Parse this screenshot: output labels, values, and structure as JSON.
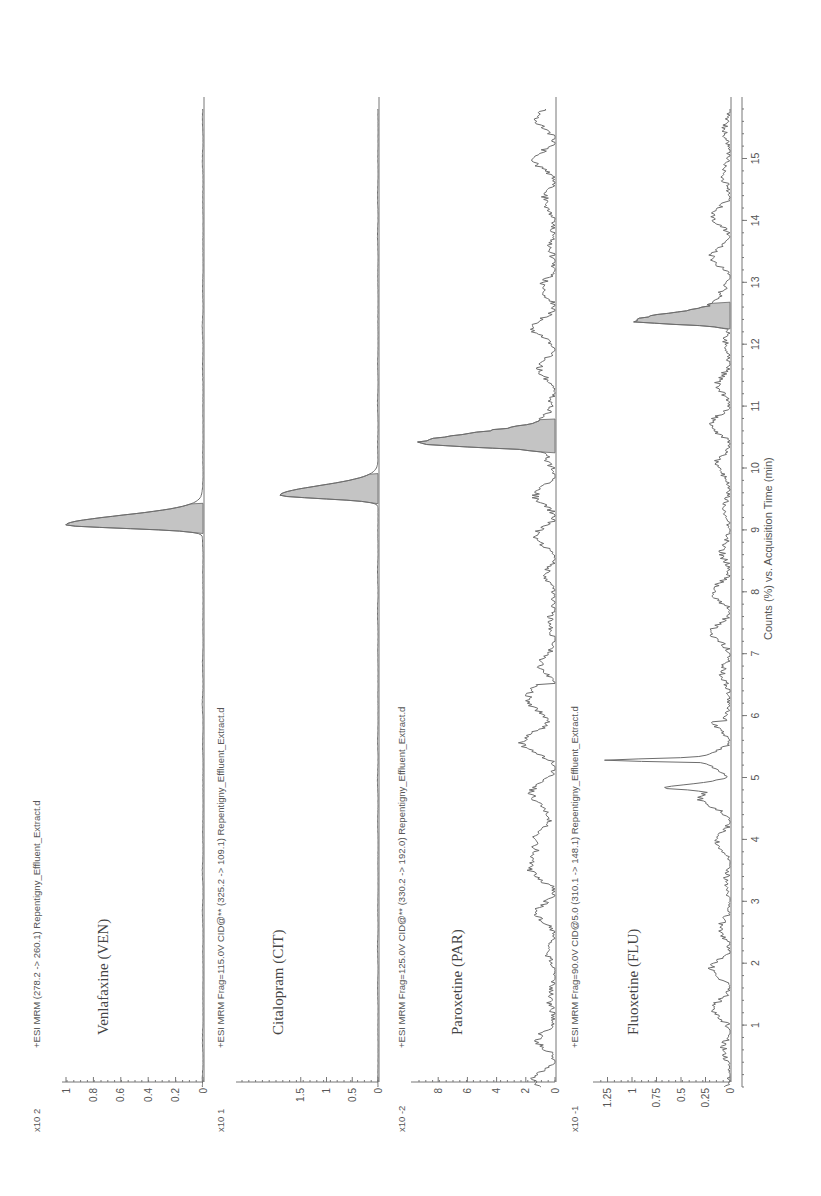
{
  "figure": {
    "orientation": "rotated-90-ccw",
    "x_axis_label": "Counts (%) vs. Acquisition Time (min)",
    "time_ticks": [
      1,
      2,
      3,
      4,
      5,
      6,
      7,
      8,
      9,
      10,
      11,
      12,
      13,
      14,
      15
    ],
    "colors": {
      "trace": "#6d6d6d",
      "peak_fill": "#c4c4c4",
      "axis": "#777777"
    }
  },
  "panels": [
    {
      "id": "ven",
      "header": "+ESI MRM (278.2 -> 260.1) Repentigny_Effluent_Extract.d",
      "compound": "Venlafaxine (VEN)",
      "scale": "x10 2",
      "y_ticks": [
        "1",
        "0.8",
        "0.6",
        "0.4",
        "0.2",
        "0"
      ],
      "y_tick_values": [
        1,
        0.8,
        0.6,
        0.4,
        0.2,
        0
      ],
      "y_max": 1.0
    },
    {
      "id": "cit",
      "header": "+ESI MRM Frag=115.0V CID@** (325.2 -> 109.1) Repentigny_Effluent_Extract.d",
      "compound": "Citalopram (CIT)",
      "scale": "x10 1",
      "y_ticks": [
        "1.5",
        "1",
        "0.5",
        "0"
      ],
      "y_tick_values": [
        1.5,
        1,
        0.5,
        0
      ],
      "y_max": 1.9
    },
    {
      "id": "par",
      "header": "+ESI MRM Frag=125.0V CID@** (330.2 -> 192.0) Repentigny_Effluent_Extract.d",
      "compound": "Paroxetine (PAR)",
      "scale": "x10 -2",
      "y_ticks": [
        "8",
        "6",
        "4",
        "2",
        "0"
      ],
      "y_tick_values": [
        8,
        6,
        4,
        2,
        0
      ],
      "y_max": 9.6
    },
    {
      "id": "flu",
      "header": "+ESI MRM Frag=90.0V CID@5.0 (310.1 -> 148.1) Repentigny_Effluent_Extract.d",
      "compound": "Fluoxetine (FLU)",
      "scale": "x10 -1",
      "y_ticks": [
        "1.25",
        "1",
        "0.75",
        "0.5",
        "0.25",
        "0"
      ],
      "y_tick_values": [
        1.25,
        1,
        0.75,
        0.5,
        0.25,
        0
      ],
      "y_max": 1.4
    }
  ],
  "chart_data": {
    "type": "line",
    "title": "",
    "xlabel": "Counts (%) vs. Acquisition Time (min)",
    "ylabel": "Counts",
    "xlim": [
      0,
      15.8
    ],
    "grid": false,
    "legend": "none",
    "layout": "4 stacked panels, figure rotated 90 degrees counter-clockwise",
    "x_ticks": [
      1,
      2,
      3,
      4,
      5,
      6,
      7,
      8,
      9,
      10,
      11,
      12,
      13,
      14,
      15
    ],
    "series": [
      {
        "name": "Venlafaxine (VEN)",
        "header": "+ESI MRM (278.2 -> 260.1) Repentigny_Effluent_Extract.d",
        "scale": "x10^2",
        "ylim": [
          0,
          1
        ],
        "y_ticks": [
          0,
          0.2,
          0.4,
          0.6,
          0.8,
          1
        ],
        "peaks": [
          {
            "rt_min": 9.08,
            "height": 1.0,
            "width_min": 0.25
          }
        ],
        "baseline_noise": 0.005
      },
      {
        "name": "Citalopram (CIT)",
        "header": "+ESI MRM Frag=115.0V CID@** (325.2 -> 109.1) Repentigny_Effluent_Extract.d",
        "scale": "x10^1",
        "ylim": [
          0,
          1.9
        ],
        "y_ticks": [
          0,
          0.5,
          1,
          1.5
        ],
        "peaks": [
          {
            "rt_min": 9.56,
            "height": 1.9,
            "width_min": 0.25
          }
        ],
        "baseline_noise": 0.01
      },
      {
        "name": "Paroxetine (PAR)",
        "header": "+ESI MRM Frag=125.0V CID@** (330.2 -> 192.0) Repentigny_Effluent_Extract.d",
        "scale": "x10^-2",
        "ylim": [
          0,
          9.6
        ],
        "y_ticks": [
          0,
          2,
          4,
          6,
          8
        ],
        "peaks": [
          {
            "rt_min": 10.4,
            "height": 9.1,
            "width_min": 0.28
          }
        ],
        "baseline_noise": 1.5
      },
      {
        "name": "Fluoxetine (FLU)",
        "header": "+ESI MRM Frag=90.0V CID@5.0 (310.1 -> 148.1) Repentigny_Effluent_Extract.d",
        "scale": "x10^-1",
        "ylim": [
          0,
          1.4
        ],
        "y_ticks": [
          0,
          0.25,
          0.5,
          0.75,
          1,
          1.25
        ],
        "peaks": [
          {
            "rt_min": 12.37,
            "height": 0.98,
            "width_min": 0.22,
            "filled": true
          },
          {
            "rt_min": 5.27,
            "height": 1.05,
            "width_min": 0.05,
            "filled": false
          },
          {
            "rt_min": 4.83,
            "height": 0.55,
            "width_min": 0.12,
            "filled": false
          }
        ],
        "baseline_noise": 0.2
      }
    ]
  }
}
